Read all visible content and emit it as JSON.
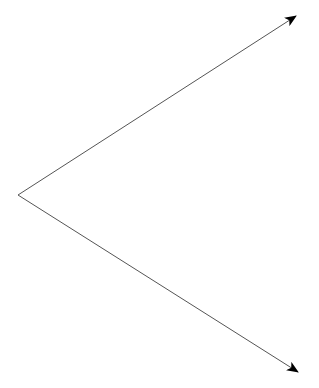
{
  "diagram": {
    "type": "angle",
    "vertex": [
      18,
      195
    ],
    "rays": [
      {
        "name": "upper-ray",
        "end": [
          296,
          16
        ]
      },
      {
        "name": "lower-ray",
        "end": [
          298,
          372
        ]
      }
    ],
    "line_color": "#555555",
    "arrow_color": "#000000"
  }
}
